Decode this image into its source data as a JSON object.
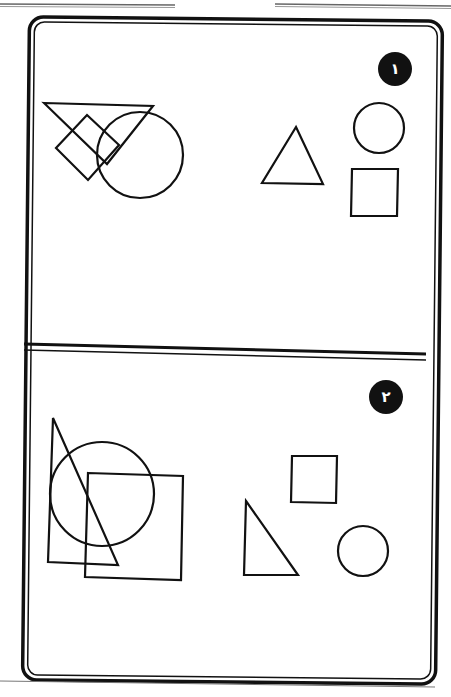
{
  "page": {
    "background": "#ffffff",
    "ink_color": "#111111",
    "header_rules": [
      {
        "x1": 0,
        "y1": 4,
        "x2": 175,
        "y2": 5
      },
      {
        "x1": 275,
        "y1": 4,
        "x2": 451,
        "y2": 6
      }
    ],
    "footer_rule": {
      "x1": 0,
      "y1": 681,
      "x2": 435,
      "y2": 687
    }
  },
  "frame": {
    "outer": {
      "x": 26,
      "y": 19,
      "w": 413,
      "h": 663,
      "r": 14
    },
    "inner": {
      "x": 31,
      "y": 24,
      "w": 403,
      "h": 653,
      "r": 10
    },
    "divider": [
      {
        "x1": 24,
        "y1": 344,
        "x2": 426,
        "y2": 354
      },
      {
        "x1": 24,
        "y1": 350,
        "x2": 426,
        "y2": 360
      }
    ]
  },
  "panels": [
    {
      "id": 1,
      "badge": {
        "label": "١",
        "cx": 395,
        "cy": 69,
        "r": 17,
        "color": "#111111"
      },
      "overlapping_shapes": [
        {
          "type": "triangle",
          "points": "44,103 153,106 107,164"
        },
        {
          "type": "square",
          "points": "87,115 119,145 88,180 56,148"
        },
        {
          "type": "circle",
          "cx": 140,
          "cy": 155,
          "r": 43
        }
      ],
      "separate_shapes": [
        {
          "type": "triangle",
          "points": "296,127 323,184 262,183"
        },
        {
          "type": "circle",
          "cx": 379,
          "cy": 128,
          "r": 25
        },
        {
          "type": "square",
          "points": "352,169 398,169 397,216 351,216"
        }
      ]
    },
    {
      "id": 2,
      "badge": {
        "label": "٢",
        "cx": 386,
        "cy": 397,
        "r": 17,
        "color": "#111111"
      },
      "overlapping_shapes": [
        {
          "type": "triangle",
          "points": "53,418 118,565 48,562"
        },
        {
          "type": "circle",
          "cx": 102,
          "cy": 494,
          "r": 52
        },
        {
          "type": "square",
          "points": "88,473 183,476 181,580 85,577"
        }
      ],
      "separate_shapes": [
        {
          "type": "square",
          "points": "292,456 337,456 336,503 291,502"
        },
        {
          "type": "triangle",
          "points": "246,501 298,575 244,575"
        },
        {
          "type": "circle",
          "cx": 363,
          "cy": 551,
          "r": 25
        }
      ]
    }
  ]
}
